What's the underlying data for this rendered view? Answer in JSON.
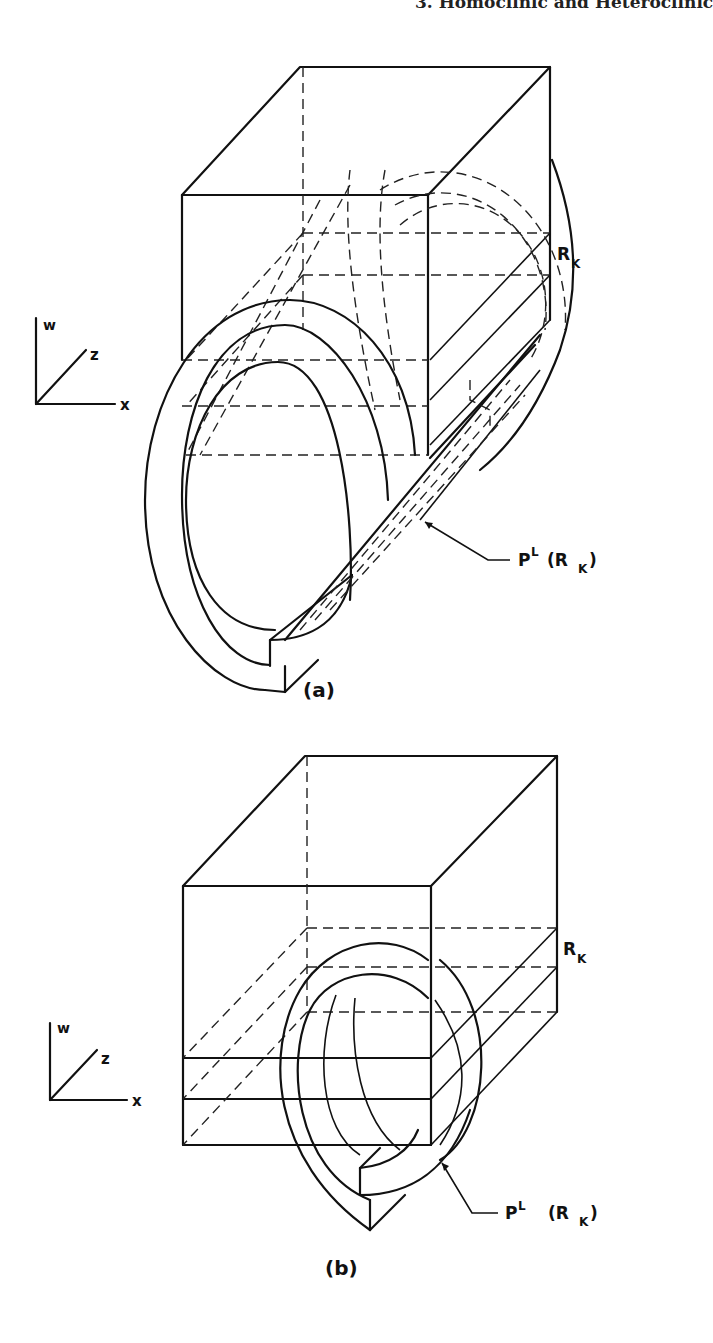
{
  "header": {
    "running_head": "3. Homoclinic and Heteroclinic"
  },
  "figures": [
    {
      "id": "a",
      "caption": "(a)",
      "axes": {
        "w": "w",
        "z": "z",
        "x": "x"
      },
      "labels": {
        "region": "R",
        "region_sub": "K",
        "preimage_main": "P",
        "preimage_sup": "L",
        "preimage_arg_open": "(R",
        "preimage_arg_sub": "K",
        "preimage_arg_close": ")"
      }
    },
    {
      "id": "b",
      "caption": "(b)",
      "axes": {
        "w": "w",
        "z": "z",
        "x": "x"
      },
      "labels": {
        "region": "R",
        "region_sub": "K",
        "preimage_main": "P",
        "preimage_sup": "L",
        "preimage_arg_open": "(R",
        "preimage_arg_sub": "K",
        "preimage_arg_close": ")"
      }
    }
  ]
}
